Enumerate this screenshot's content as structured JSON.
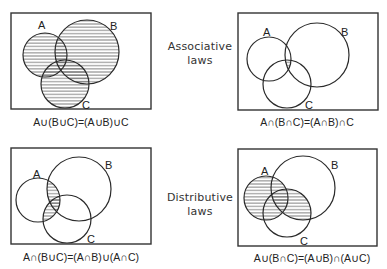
{
  "law_labels": {
    "associative": {
      "line1": "Associative",
      "line2": "laws"
    },
    "distributive": {
      "line1": "Distributive",
      "line2": "laws"
    }
  },
  "panels": [
    {
      "id": "assoc-union",
      "formula": "A∪(B∪C)=(A∪B)∪C",
      "shaded_region": "A ∪ B ∪ C",
      "set_labels": [
        "A",
        "B",
        "C"
      ]
    },
    {
      "id": "assoc-intersection",
      "formula": "A∩(B∩C)=(A∩B)∩C",
      "shaded_region": "A ∩ B ∩ C",
      "set_labels": [
        "A",
        "B",
        "C"
      ]
    },
    {
      "id": "dist-intersection",
      "formula": "A∩(B∪C)=(A∩B)∪(A∩C)",
      "shaded_region": "A ∩ (B ∪ C)",
      "set_labels": [
        "A",
        "B",
        "C"
      ]
    },
    {
      "id": "dist-union",
      "formula": "A∪(B∩C)=(A∪B)∩(A∪C)",
      "shaded_region": "A ∪ (B ∩ C)",
      "set_labels": [
        "A",
        "B",
        "C"
      ]
    }
  ],
  "colors": {
    "stroke": "#2a2a2a",
    "hatch": "#555555",
    "background": "#ffffff"
  }
}
